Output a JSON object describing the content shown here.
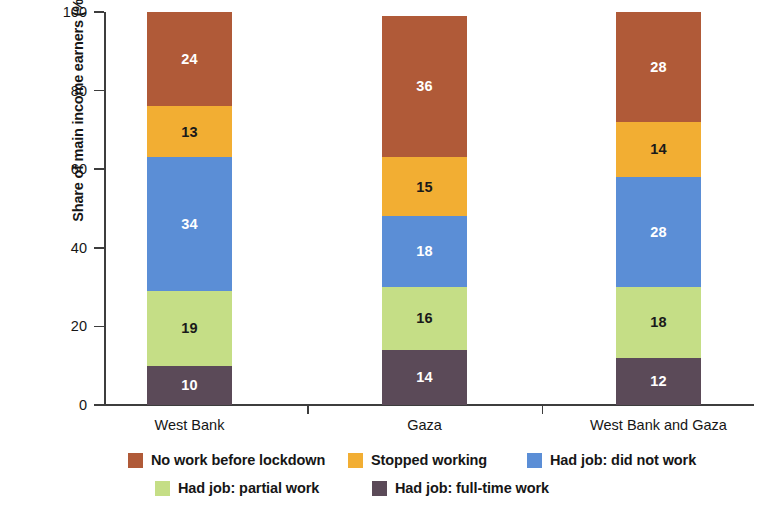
{
  "chart_data": {
    "type": "bar",
    "subtype": "stacked-bar-100",
    "title": "",
    "xlabel": "",
    "ylabel": "Share of main income earners (%)",
    "ylim": [
      0,
      100
    ],
    "yticks": [
      0,
      20,
      40,
      60,
      80,
      100
    ],
    "ytick_labels": [
      "0",
      "20",
      "40",
      "60",
      "80",
      "100"
    ],
    "grid": false,
    "legend_position": "bottom",
    "categories": [
      "West Bank",
      "Gaza",
      "West Bank and Gaza"
    ],
    "series": [
      {
        "name": "Had job: full-time work",
        "color": "#5B4A58",
        "label_color": "light",
        "values": [
          10,
          14,
          12
        ]
      },
      {
        "name": "Had job: partial work",
        "color": "#C5DE86",
        "label_color": "dark",
        "values": [
          19,
          16,
          18
        ]
      },
      {
        "name": "Had job: did not work",
        "color": "#5B8ED6",
        "label_color": "light",
        "values": [
          34,
          18,
          28
        ]
      },
      {
        "name": "Stopped working",
        "color": "#F2AE33",
        "label_color": "dark",
        "values": [
          13,
          15,
          14
        ]
      },
      {
        "name": "No work before lockdown",
        "color": "#B05A38",
        "label_color": "light",
        "values": [
          24,
          36,
          28
        ]
      }
    ],
    "legend_entries": [
      {
        "label": "No work before lockdown",
        "color": "#B05A38"
      },
      {
        "label": "Stopped working",
        "color": "#F2AE33"
      },
      {
        "label": "Had job: did not work",
        "color": "#5B8ED6"
      },
      {
        "label": "Had job: partial work",
        "color": "#C5DE86"
      },
      {
        "label": "Had job: full-time work",
        "color": "#5B4A58"
      }
    ]
  }
}
